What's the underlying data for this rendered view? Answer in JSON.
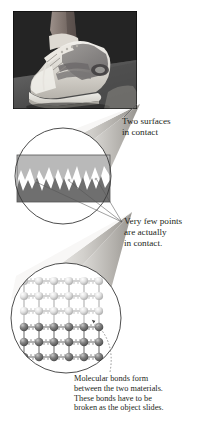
{
  "figure": {
    "background_color": "#ffffff",
    "text_color": "#231f20"
  },
  "photo": {
    "name": "sneaker-on-surface-photograph",
    "subject": "athletic sneaker shoe on a foot resting on a dark surface",
    "frame": {
      "x": 13,
      "y": 11,
      "width": 124,
      "height": 98
    },
    "colors": {
      "background_dark": "#2b2b2b",
      "background_mid": "#4a4a4a",
      "shoe_light": "#e8e6e1",
      "shoe_mid": "#a9a6a0",
      "shoe_dark": "#5c595a",
      "skin": "#8e837c"
    }
  },
  "cones": [
    {
      "name": "magnifier-cone-upper",
      "from": "surface-contact-circle",
      "to": "photograph",
      "apex": {
        "x": 140,
        "y": 104
      }
    },
    {
      "name": "magnifier-cone-lower",
      "from": "molecular-circle",
      "to": "surface-contact-circle",
      "apex": {
        "x": 132,
        "y": 212
      }
    }
  ],
  "circles": [
    {
      "name": "surface-contact-circle",
      "center": {
        "x": 63,
        "y": 176
      },
      "radius": 48,
      "content": "two jagged interlocking surfaces in contact",
      "colors": {
        "upper_material": "#b9b9b9",
        "lower_material": "#6f6f6f",
        "gap": "#ffffff",
        "outline": "#3a3a3a"
      }
    },
    {
      "name": "molecular-circle",
      "center": {
        "x": 66,
        "y": 318
      },
      "radius": 55,
      "content": "molecular lattice of spheres joined by spring bonds",
      "colors": {
        "upper_atoms": "#d8d8d8",
        "lower_atoms": "#6a6a6a",
        "spring_bonds": "#b0b0b0",
        "outline": "#3a3a3a"
      }
    }
  ],
  "callouts": {
    "two_surfaces": {
      "text": "Two surfaces\nin contact",
      "lines": [
        "Two surfaces",
        "in contact"
      ],
      "leader": "short straight line from text up-left to the cone apex"
    },
    "few_points": {
      "text": "Very few points\nare actually\nin contact.",
      "lines": [
        "Very few points",
        "are actually",
        "in contact."
      ],
      "leader": "three thin straight lines fanning to contact peaks"
    },
    "molecular_bonds": {
      "text": "Molecular bonds form\nbetween the two materials.\nThese bonds have to be\nbroken as the object slides.",
      "lines": [
        "Molecular bonds form",
        "between the two materials.",
        "These bonds have to be",
        "broken as the object slides."
      ],
      "leader": "dotted curved line with arrowhead pointing to a bond"
    }
  }
}
